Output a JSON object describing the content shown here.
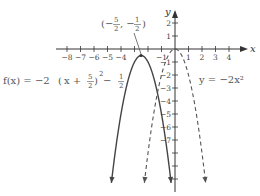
{
  "chart_data": {
    "type": "line",
    "title": "",
    "xlabel": "x",
    "ylabel": "y",
    "xlim": [
      -9,
      4.7
    ],
    "ylim": [
      -10.4,
      2.8
    ],
    "x_ticks": [
      -8,
      -7,
      -6,
      -5,
      -4,
      -3,
      -2,
      -1,
      1,
      2,
      3,
      4
    ],
    "x_tick_labels": {
      "-8": "−8",
      "-7": "−7",
      "-6": "−6",
      "-5": "−5",
      "-4": "−4",
      "-1": "−1",
      "1": "1",
      "2": "2",
      "3": "3",
      "4": "4"
    },
    "y_ticks": [
      2,
      1,
      -1,
      -2,
      -3,
      -4,
      -5,
      -6,
      -7,
      -8,
      -9,
      -10
    ],
    "y_tick_labels": {
      "2": "2",
      "1": "1",
      "-1": "−1",
      "-2": "−2",
      "-3": "−3",
      "-4": "−4",
      "-5": "−5",
      "-6": "−6",
      "-7": "−7"
    },
    "grid": false,
    "series": [
      {
        "name": "f(x) = −2(x + 5/2)² − 1/2",
        "function": {
          "a": -2,
          "h": -2.5,
          "k": -0.5
        },
        "style": "solid",
        "color": "#444444"
      },
      {
        "name": "y = −2x²",
        "function": {
          "a": -2,
          "h": 0,
          "k": 0
        },
        "style": "dashed",
        "color": "#555555"
      }
    ],
    "annotations": {
      "vertex_point": {
        "x": -2.5,
        "y": -0.5,
        "label_open": "(−",
        "num1": "5",
        "den1": "2",
        "mid": ", −",
        "num2": "1",
        "den2": "2",
        "label_close": ")"
      },
      "f_label": {
        "prefix": "f(x) = −2",
        "inner": "x + ",
        "num": "5",
        "den": "2",
        "sup": "2",
        "suffix": " − ",
        "num2": "1",
        "den2": "2"
      },
      "g_label": "y = −2x²"
    }
  }
}
